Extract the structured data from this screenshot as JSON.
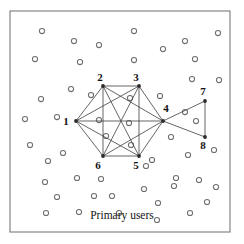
{
  "figure": {
    "caption": "Primary users",
    "caption_position": {
      "x": 122,
      "y": 219
    },
    "frame": {
      "x": 10,
      "y": 11,
      "width": 220,
      "height": 221,
      "stroke": "#7a7a78"
    },
    "colors": {
      "frame_stroke": "#7a7a78",
      "primary_user_stroke": "#6e6e6c",
      "edge_stroke": "#4a4a48",
      "node_fill": "#2b2b2b",
      "label_fill": "#111111",
      "background": "#ffffff"
    },
    "nodes": [
      {
        "id": "1",
        "label": "1",
        "x": 76,
        "y": 121,
        "label_x": 66,
        "label_y": 125
      },
      {
        "id": "2",
        "label": "2",
        "x": 103,
        "y": 86,
        "label_x": 100,
        "label_y": 81
      },
      {
        "id": "3",
        "label": "3",
        "x": 139,
        "y": 86,
        "label_x": 136,
        "label_y": 81
      },
      {
        "id": "4",
        "label": "4",
        "x": 163,
        "y": 121,
        "label_x": 166,
        "label_y": 112
      },
      {
        "id": "5",
        "label": "5",
        "x": 139,
        "y": 156,
        "label_x": 136,
        "label_y": 169
      },
      {
        "id": "6",
        "label": "6",
        "x": 103,
        "y": 156,
        "label_x": 98,
        "label_y": 169
      },
      {
        "id": "7",
        "label": "7",
        "x": 205,
        "y": 101,
        "label_x": 203,
        "label_y": 95
      },
      {
        "id": "8",
        "label": "8",
        "x": 205,
        "y": 137,
        "label_x": 203,
        "label_y": 149
      }
    ],
    "edges": [
      {
        "from": "1",
        "to": "2"
      },
      {
        "from": "1",
        "to": "3"
      },
      {
        "from": "1",
        "to": "4"
      },
      {
        "from": "1",
        "to": "5"
      },
      {
        "from": "1",
        "to": "6"
      },
      {
        "from": "2",
        "to": "3"
      },
      {
        "from": "2",
        "to": "4"
      },
      {
        "from": "2",
        "to": "5"
      },
      {
        "from": "2",
        "to": "6"
      },
      {
        "from": "3",
        "to": "4"
      },
      {
        "from": "3",
        "to": "5"
      },
      {
        "from": "3",
        "to": "6"
      },
      {
        "from": "4",
        "to": "5"
      },
      {
        "from": "4",
        "to": "6"
      },
      {
        "from": "5",
        "to": "6"
      },
      {
        "from": "4",
        "to": "7"
      },
      {
        "from": "4",
        "to": "8"
      },
      {
        "from": "7",
        "to": "8"
      }
    ],
    "primary_users": [
      {
        "x": 42,
        "y": 31
      },
      {
        "x": 74,
        "y": 41
      },
      {
        "x": 99,
        "y": 45
      },
      {
        "x": 134,
        "y": 31
      },
      {
        "x": 163,
        "y": 49
      },
      {
        "x": 185,
        "y": 41
      },
      {
        "x": 218,
        "y": 33
      },
      {
        "x": 35,
        "y": 59
      },
      {
        "x": 80,
        "y": 62
      },
      {
        "x": 134,
        "y": 60
      },
      {
        "x": 195,
        "y": 59
      },
      {
        "x": 41,
        "y": 99
      },
      {
        "x": 71,
        "y": 89
      },
      {
        "x": 91,
        "y": 95
      },
      {
        "x": 160,
        "y": 96
      },
      {
        "x": 192,
        "y": 79
      },
      {
        "x": 219,
        "y": 80
      },
      {
        "x": 25,
        "y": 119
      },
      {
        "x": 57,
        "y": 117
      },
      {
        "x": 130,
        "y": 98
      },
      {
        "x": 99,
        "y": 120
      },
      {
        "x": 129,
        "y": 123
      },
      {
        "x": 185,
        "y": 112
      },
      {
        "x": 196,
        "y": 121
      },
      {
        "x": 106,
        "y": 136
      },
      {
        "x": 131,
        "y": 145
      },
      {
        "x": 171,
        "y": 137
      },
      {
        "x": 30,
        "y": 145
      },
      {
        "x": 63,
        "y": 153
      },
      {
        "x": 152,
        "y": 160
      },
      {
        "x": 188,
        "y": 155
      },
      {
        "x": 214,
        "y": 150
      },
      {
        "x": 48,
        "y": 161
      },
      {
        "x": 146,
        "y": 166
      },
      {
        "x": 45,
        "y": 182
      },
      {
        "x": 77,
        "y": 178
      },
      {
        "x": 101,
        "y": 179
      },
      {
        "x": 176,
        "y": 178
      },
      {
        "x": 199,
        "y": 180
      },
      {
        "x": 57,
        "y": 197
      },
      {
        "x": 174,
        "y": 186
      },
      {
        "x": 94,
        "y": 196
      },
      {
        "x": 112,
        "y": 196
      },
      {
        "x": 144,
        "y": 189
      },
      {
        "x": 157,
        "y": 220
      },
      {
        "x": 216,
        "y": 187
      },
      {
        "x": 46,
        "y": 213
      },
      {
        "x": 79,
        "y": 212
      },
      {
        "x": 119,
        "y": 213
      },
      {
        "x": 190,
        "y": 213
      },
      {
        "x": 158,
        "y": 203
      },
      {
        "x": 207,
        "y": 202
      }
    ]
  }
}
